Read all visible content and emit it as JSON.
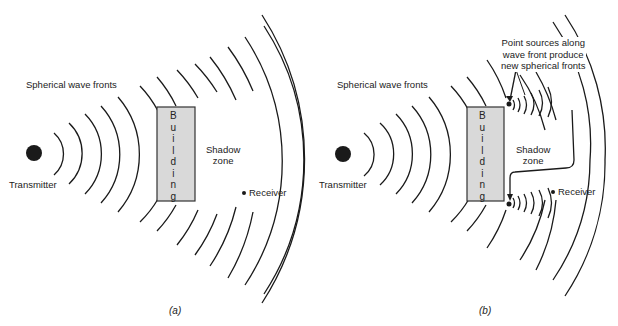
{
  "panels": [
    {
      "id": "a",
      "caption": "(a)",
      "labels": {
        "wave_fronts": "Spherical wave fronts",
        "transmitter": "Transmitter",
        "building": [
          "B",
          "u",
          "i",
          "l",
          "d",
          "i",
          "n",
          "g"
        ],
        "shadow_zone_line1": "Shadow",
        "shadow_zone_line2": "zone",
        "receiver": "Receiver"
      }
    },
    {
      "id": "b",
      "caption": "(b)",
      "labels": {
        "wave_fronts": "Spherical wave fronts",
        "transmitter": "Transmitter",
        "building": [
          "B",
          "u",
          "i",
          "l",
          "d",
          "i",
          "n",
          "g"
        ],
        "shadow_zone_line1": "Shadow",
        "shadow_zone_line2": "zone",
        "receiver": "Receiver",
        "annotation_line1": "Point sources along",
        "annotation_line2": "wave front produce",
        "annotation_line3": "new spherical fronts"
      }
    }
  ],
  "colors": {
    "line": "#1a1a1a",
    "building_fill": "#d9d9d9",
    "building_stroke": "#333333"
  }
}
